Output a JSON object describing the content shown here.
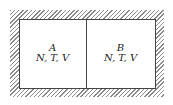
{
  "diagram": {
    "compartments": [
      {
        "name": "A",
        "vars": "N, T, V"
      },
      {
        "name": "B",
        "vars": "N, T, V"
      }
    ],
    "wall": "hatched-insulating-boundary"
  }
}
